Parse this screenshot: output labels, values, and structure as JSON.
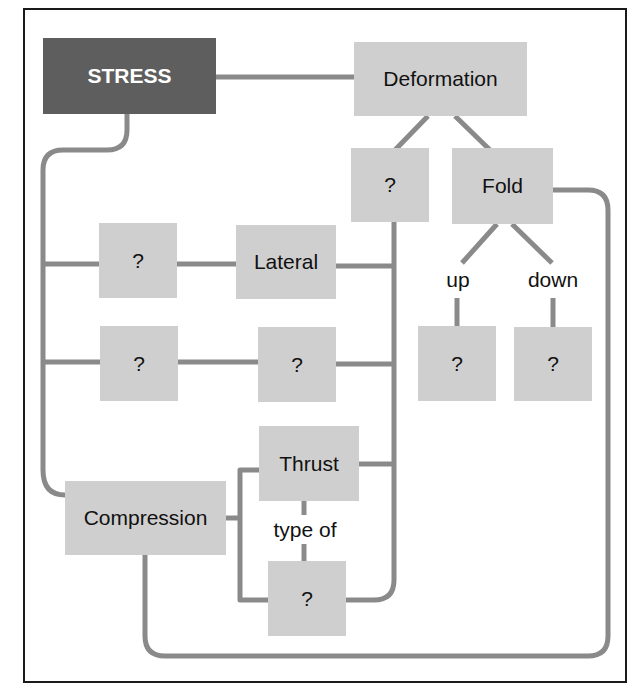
{
  "diagram": {
    "type": "concept-map",
    "colors": {
      "root_fill": "#5e5e5e",
      "node_fill": "#cfcfcf",
      "connector": "#8a8a8a",
      "frame": "#1a1a1a"
    },
    "nodes": {
      "stress": "STRESS",
      "deformation": "Deformation",
      "deformation_unknown": "?",
      "fold": "Fold",
      "row1_unknown": "?",
      "lateral": "Lateral",
      "row2_unknown_a": "?",
      "row2_unknown_b": "?",
      "fold_up_unknown": "?",
      "fold_down_unknown": "?",
      "thrust": "Thrust",
      "compression": "Compression",
      "thrust_type_unknown": "?"
    },
    "edge_labels": {
      "up": "up",
      "down": "down",
      "type_of": "type of"
    }
  }
}
